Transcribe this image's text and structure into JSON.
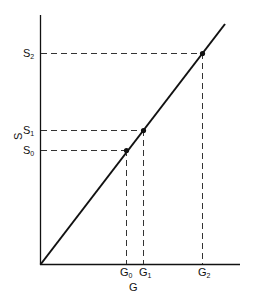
{
  "diagram": {
    "y_axis_label": "S",
    "x_axis_label": "G",
    "y_ticks": [
      {
        "label": "S",
        "sub": "2"
      },
      {
        "label": "S",
        "sub": "1"
      },
      {
        "label": "S",
        "sub": "0"
      }
    ],
    "x_ticks": [
      {
        "label": "G",
        "sub": "0"
      },
      {
        "label": "G",
        "sub": "1"
      },
      {
        "label": "G",
        "sub": "2"
      }
    ],
    "line": "linear relation S vs G through origin",
    "points": [
      {
        "name": "P0",
        "x_label": "G0",
        "y_label": "S0"
      },
      {
        "name": "P1",
        "x_label": "G1",
        "y_label": "S1"
      },
      {
        "name": "P2",
        "x_label": "G2",
        "y_label": "S2"
      }
    ],
    "colors": {
      "ink": "#111111",
      "background": "#ffffff"
    }
  }
}
